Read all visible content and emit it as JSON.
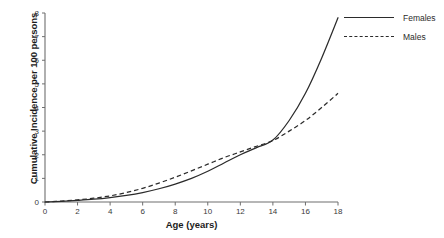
{
  "chart_data": {
    "type": "line",
    "title": "",
    "xlabel": "Age (years)",
    "ylabel": "Cumulative Incidence per 100 persons",
    "xlim": [
      0,
      18
    ],
    "ylim": [
      0,
      8
    ],
    "xticks": [
      "0",
      "2",
      "4",
      "6",
      "8",
      "10",
      "12",
      "14",
      "16",
      "18"
    ],
    "yticks": [
      "0",
      "1",
      "2",
      "3",
      "4",
      "5",
      "6",
      "7",
      "8"
    ],
    "grid": false,
    "legend_position": "top-right",
    "x": [
      0,
      1,
      2,
      3,
      4,
      5,
      6,
      7,
      8,
      9,
      10,
      11,
      12,
      13,
      14,
      15,
      16,
      17,
      18
    ],
    "series": [
      {
        "name": "Females",
        "style": "solid",
        "color": "#2b2b2b",
        "values": [
          0,
          0.03,
          0.07,
          0.12,
          0.19,
          0.28,
          0.4,
          0.56,
          0.76,
          1.0,
          1.3,
          1.65,
          2.0,
          2.3,
          2.62,
          3.45,
          4.6,
          6.1,
          7.8
        ]
      },
      {
        "name": "Males",
        "style": "dashed",
        "color": "#2b2b2b",
        "values": [
          0,
          0.04,
          0.09,
          0.16,
          0.26,
          0.4,
          0.58,
          0.8,
          1.05,
          1.32,
          1.6,
          1.88,
          2.12,
          2.36,
          2.6,
          3.0,
          3.45,
          4.0,
          4.6
        ]
      }
    ],
    "annotations": []
  },
  "legend": {
    "items": [
      {
        "label": "Females",
        "style": "solid"
      },
      {
        "label": "Males",
        "style": "dashed"
      }
    ]
  },
  "axes": {
    "x_title": "Age (years)",
    "y_title": "Cumulative Incidence per 100 persons"
  },
  "colors": {
    "line": "#2b2b2b",
    "axis": "#6e6e6e",
    "text": "#1c1c1c",
    "background": "#ffffff"
  }
}
